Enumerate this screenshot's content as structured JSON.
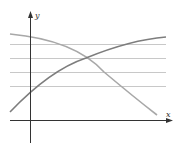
{
  "diagram": {
    "axes": {
      "x_label": "x",
      "y_label": "y",
      "color": "#333333"
    },
    "gridlines": {
      "color": "#c8c8c8",
      "y_positions_px": [
        44,
        58,
        72,
        86
      ],
      "x_start_px": 10,
      "x_end_px": 166
    },
    "curves": [
      {
        "name": "increasing-curve",
        "color": "#7d7d7d",
        "description": "concave increasing curve"
      },
      {
        "name": "decreasing-curve",
        "color": "#a8a8a8",
        "description": "concave decreasing curve"
      }
    ],
    "intersection_px": [
      86,
      58
    ]
  }
}
